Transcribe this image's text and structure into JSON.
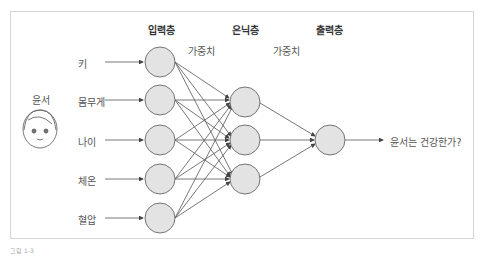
{
  "layers": {
    "input": "입력층",
    "hidden": "은닉층",
    "output": "출력층"
  },
  "weights": [
    "가중치",
    "가중치"
  ],
  "person": {
    "name": "윤서"
  },
  "inputs": [
    "키",
    "몸무게",
    "나이",
    "체온",
    "혈압"
  ],
  "output_label": "윤서는 건강한가?",
  "caption": "그림 1-3"
}
